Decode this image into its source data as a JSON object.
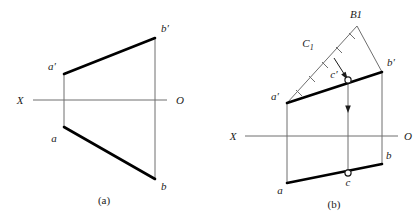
{
  "figure": {
    "background_color": "#ffffff",
    "ink_color": "#1b1b1b",
    "thin_line_color": "#6e6e6e",
    "thick_line_color": "#000000"
  },
  "panel_a": {
    "caption": "(a)",
    "axis": {
      "left_label": "X",
      "right_label": "O"
    },
    "points": [
      {
        "name": "a-prime",
        "label": "a′"
      },
      {
        "name": "b-prime",
        "label": "b′"
      },
      {
        "name": "a",
        "label": "a"
      },
      {
        "name": "b",
        "label": "b"
      }
    ]
  },
  "panel_b": {
    "caption": "(b)",
    "axis": {
      "left_label": "X",
      "right_label": "O"
    },
    "points": [
      {
        "name": "a-prime",
        "label": "a′"
      },
      {
        "name": "b-prime",
        "label": "b′"
      },
      {
        "name": "c-prime",
        "label": "c′"
      },
      {
        "name": "a",
        "label": "a"
      },
      {
        "name": "b",
        "label": "b"
      },
      {
        "name": "c",
        "label": "c"
      },
      {
        "name": "B1",
        "label": "B1"
      },
      {
        "name": "C1",
        "label": "C"
      },
      {
        "name": "C1-subscript",
        "label": "1"
      }
    ]
  }
}
